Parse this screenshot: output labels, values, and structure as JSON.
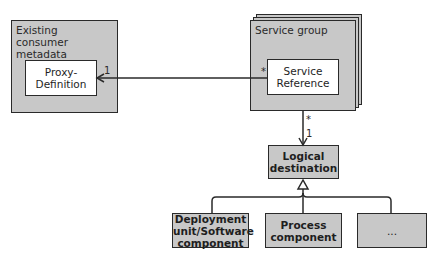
{
  "diagram": {
    "containers": [
      {
        "id": "existing-consumer-metadata",
        "title": "Existing consumer metadata",
        "title_lines": [
          "Existing",
          "consumer metadata"
        ]
      },
      {
        "id": "service-group",
        "title": "Service group",
        "stacked": true
      }
    ],
    "nodes": {
      "proxy_definition": "Proxy-\nDefinition",
      "service_reference": "Service\nReference",
      "logical_destination": "Logical\ndestination",
      "deployment_unit": "Deployment\nunit/Software\ncomponent",
      "process_component": "Process\ncomponent",
      "ellipsis": "..."
    },
    "edges": [
      {
        "from": "Service Reference",
        "to": "Proxy-Definition",
        "type": "association-arrow",
        "source_multiplicity": "*",
        "target_multiplicity": "1"
      },
      {
        "from": "Service group",
        "to": "Logical destination",
        "type": "association-arrow",
        "source_multiplicity": "*",
        "target_multiplicity": "1"
      },
      {
        "from": "Deployment unit/Software component",
        "to": "Logical destination",
        "type": "generalization"
      },
      {
        "from": "Process component",
        "to": "Logical destination",
        "type": "generalization"
      },
      {
        "from": "...",
        "to": "Logical destination",
        "type": "generalization"
      }
    ],
    "multiplicities": {
      "proxy_end": "1",
      "service_ref_end": "*",
      "service_group_end": "*",
      "logical_dest_end": "1"
    },
    "colors": {
      "box_fill_gray": "#c8c8c8",
      "box_fill_white": "#ffffff",
      "stroke": "#2a2a2a"
    }
  }
}
